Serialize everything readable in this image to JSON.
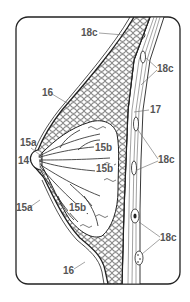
{
  "diagram": {
    "colors": {
      "line": "#222222",
      "label": "#555555",
      "background": "#ffffff"
    },
    "labels": [
      {
        "id": "lbl-18c-top",
        "text": "18c",
        "x": 80,
        "y": 28
      },
      {
        "id": "lbl-18c-upper-right",
        "text": "18c",
        "x": 157,
        "y": 64
      },
      {
        "id": "lbl-16-upper",
        "text": "16",
        "x": 42,
        "y": 88
      },
      {
        "id": "lbl-17",
        "text": "17",
        "x": 150,
        "y": 105
      },
      {
        "id": "lbl-15a-upper",
        "text": "15a",
        "x": 20,
        "y": 138
      },
      {
        "id": "lbl-15b-top",
        "text": "15b",
        "x": 94,
        "y": 143
      },
      {
        "id": "lbl-18c-mid-right",
        "text": "18c",
        "x": 158,
        "y": 155
      },
      {
        "id": "lbl-14",
        "text": "14",
        "x": 18,
        "y": 156
      },
      {
        "id": "lbl-15b-mid",
        "text": "15b",
        "x": 95,
        "y": 164
      },
      {
        "id": "lbl-15a-lower",
        "text": "15a",
        "x": 16,
        "y": 203
      },
      {
        "id": "lbl-15b-lower",
        "text": "15b",
        "x": 68,
        "y": 203
      },
      {
        "id": "lbl-18c-lower-right",
        "text": "18c",
        "x": 160,
        "y": 233
      },
      {
        "id": "lbl-16-lower",
        "text": "16",
        "x": 63,
        "y": 266
      }
    ]
  }
}
